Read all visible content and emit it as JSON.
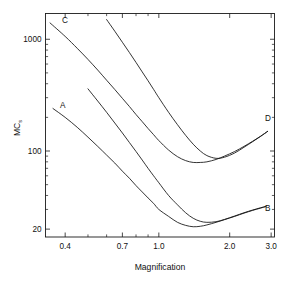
{
  "chart_data": {
    "type": "line",
    "title": "",
    "xlabel": "Magnification",
    "ylabel": "MC",
    "ylabel_subscript": "s",
    "xscale": "log",
    "yscale": "log",
    "xlim": [
      0.33,
      3.1
    ],
    "ylim": [
      17,
      1700
    ],
    "grid": false,
    "legend_position": "inline-endpoint-labels",
    "xticks": [
      0.4,
      0.7,
      1.0,
      2.0,
      3.0
    ],
    "xticklabels": [
      "0.4",
      "0.7",
      "1.0",
      "2.0",
      "3.0"
    ],
    "yticks": [
      20,
      100,
      1000
    ],
    "yticklabels": [
      "20",
      "100",
      "1000"
    ],
    "yminorticks": [
      30,
      40,
      50,
      60,
      70,
      80,
      90,
      200,
      300,
      400,
      500,
      600,
      700,
      800,
      900
    ],
    "series": [
      {
        "name": "A",
        "label": "A",
        "label_position": "start-upper-left",
        "points": [
          [
            0.355,
            240
          ],
          [
            0.4,
            200
          ],
          [
            0.45,
            163
          ],
          [
            0.5,
            133
          ],
          [
            0.55,
            110
          ],
          [
            0.6,
            92
          ],
          [
            0.65,
            78
          ],
          [
            0.7,
            66
          ],
          [
            0.75,
            57
          ],
          [
            0.8,
            49
          ],
          [
            0.85,
            43
          ],
          [
            0.9,
            38
          ],
          [
            0.95,
            34
          ],
          [
            1.0,
            30
          ],
          [
            1.1,
            26
          ],
          [
            1.2,
            23
          ],
          [
            1.3,
            21.6
          ],
          [
            1.4,
            21.0
          ],
          [
            1.5,
            21.2
          ],
          [
            1.6,
            21.8
          ],
          [
            1.75,
            23.0
          ],
          [
            1.9,
            24.3
          ],
          [
            2.1,
            26.0
          ],
          [
            2.3,
            27.8
          ],
          [
            2.5,
            29.4
          ],
          [
            2.7,
            30.8
          ],
          [
            2.85,
            31.8
          ]
        ]
      },
      {
        "name": "B",
        "label": "B",
        "label_position": "end-right-lower",
        "points": [
          [
            0.5,
            360
          ],
          [
            0.55,
            280
          ],
          [
            0.6,
            222
          ],
          [
            0.65,
            178
          ],
          [
            0.7,
            145
          ],
          [
            0.75,
            119
          ],
          [
            0.8,
            99
          ],
          [
            0.85,
            83
          ],
          [
            0.9,
            70
          ],
          [
            0.95,
            60
          ],
          [
            1.0,
            52
          ],
          [
            1.1,
            40
          ],
          [
            1.2,
            33
          ],
          [
            1.3,
            28
          ],
          [
            1.4,
            25
          ],
          [
            1.5,
            23.5
          ],
          [
            1.6,
            23.0
          ],
          [
            1.75,
            23.3
          ],
          [
            1.9,
            24.4
          ],
          [
            2.1,
            26.2
          ],
          [
            2.3,
            28.0
          ],
          [
            2.5,
            29.6
          ],
          [
            2.7,
            31.0
          ],
          [
            2.85,
            32.0
          ]
        ]
      },
      {
        "name": "C",
        "label": "C",
        "label_position": "start-top-left",
        "points": [
          [
            0.345,
            1400
          ],
          [
            0.4,
            1060
          ],
          [
            0.45,
            830
          ],
          [
            0.5,
            660
          ],
          [
            0.55,
            530
          ],
          [
            0.6,
            430
          ],
          [
            0.65,
            355
          ],
          [
            0.7,
            296
          ],
          [
            0.75,
            250
          ],
          [
            0.8,
            212
          ],
          [
            0.85,
            183
          ],
          [
            0.9,
            159
          ],
          [
            0.95,
            140
          ],
          [
            1.0,
            124
          ],
          [
            1.1,
            102
          ],
          [
            1.2,
            89
          ],
          [
            1.3,
            82
          ],
          [
            1.4,
            79
          ],
          [
            1.5,
            79
          ],
          [
            1.6,
            80
          ],
          [
            1.75,
            84
          ],
          [
            1.9,
            90
          ],
          [
            2.1,
            99
          ],
          [
            2.3,
            110
          ],
          [
            2.5,
            122
          ],
          [
            2.7,
            135
          ],
          [
            2.9,
            150
          ]
        ]
      },
      {
        "name": "D",
        "label": "D",
        "label_position": "end-right-upper",
        "points": [
          [
            0.6,
            1500
          ],
          [
            0.65,
            1180
          ],
          [
            0.7,
            940
          ],
          [
            0.75,
            760
          ],
          [
            0.8,
            620
          ],
          [
            0.85,
            510
          ],
          [
            0.9,
            425
          ],
          [
            0.95,
            356
          ],
          [
            1.0,
            300
          ],
          [
            1.1,
            222
          ],
          [
            1.2,
            172
          ],
          [
            1.3,
            138
          ],
          [
            1.4,
            115
          ],
          [
            1.5,
            100
          ],
          [
            1.6,
            91
          ],
          [
            1.75,
            86
          ],
          [
            1.9,
            88
          ],
          [
            2.1,
            96
          ],
          [
            2.3,
            108
          ],
          [
            2.5,
            121
          ],
          [
            2.7,
            135
          ],
          [
            2.9,
            150
          ]
        ]
      }
    ]
  },
  "axes": {
    "x_title": "Magnification",
    "y_title": "MC",
    "y_title_subscript": "s"
  },
  "tick_labels": {
    "x": [
      "0.4",
      "0.7",
      "1.0",
      "2.0",
      "3.0"
    ],
    "y": [
      "1000",
      "100",
      "20"
    ]
  },
  "curve_labels": {
    "a": "A",
    "b": "B",
    "c": "C",
    "d": "D"
  }
}
